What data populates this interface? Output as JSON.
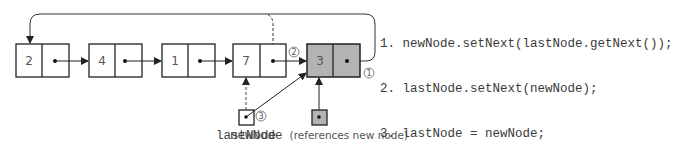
{
  "diagram": {
    "colors": {
      "stroke": "#222222",
      "new_node_fill": "#b3b3b3",
      "node_fill": "#ffffff",
      "text": "#555555"
    },
    "nodes": [
      {
        "id": "n1",
        "value": "2",
        "highlighted": false
      },
      {
        "id": "n2",
        "value": "4",
        "highlighted": false
      },
      {
        "id": "n3",
        "value": "1",
        "highlighted": false
      },
      {
        "id": "n4",
        "value": "7",
        "highlighted": false
      },
      {
        "id": "n5",
        "value": "3",
        "highlighted": true
      }
    ],
    "references": [
      {
        "id": "lastNode",
        "label": "lastNode",
        "caption": ""
      },
      {
        "id": "newNode",
        "label": "newNode",
        "caption": "(references new node)"
      }
    ],
    "step_markers": [
      "1",
      "2",
      "3"
    ],
    "code_lines": [
      "1. newNode.setNext(lastNode.getNext());",
      "2. lastNode.setNext(newNode);",
      "3. lastNode = newNode;"
    ]
  }
}
